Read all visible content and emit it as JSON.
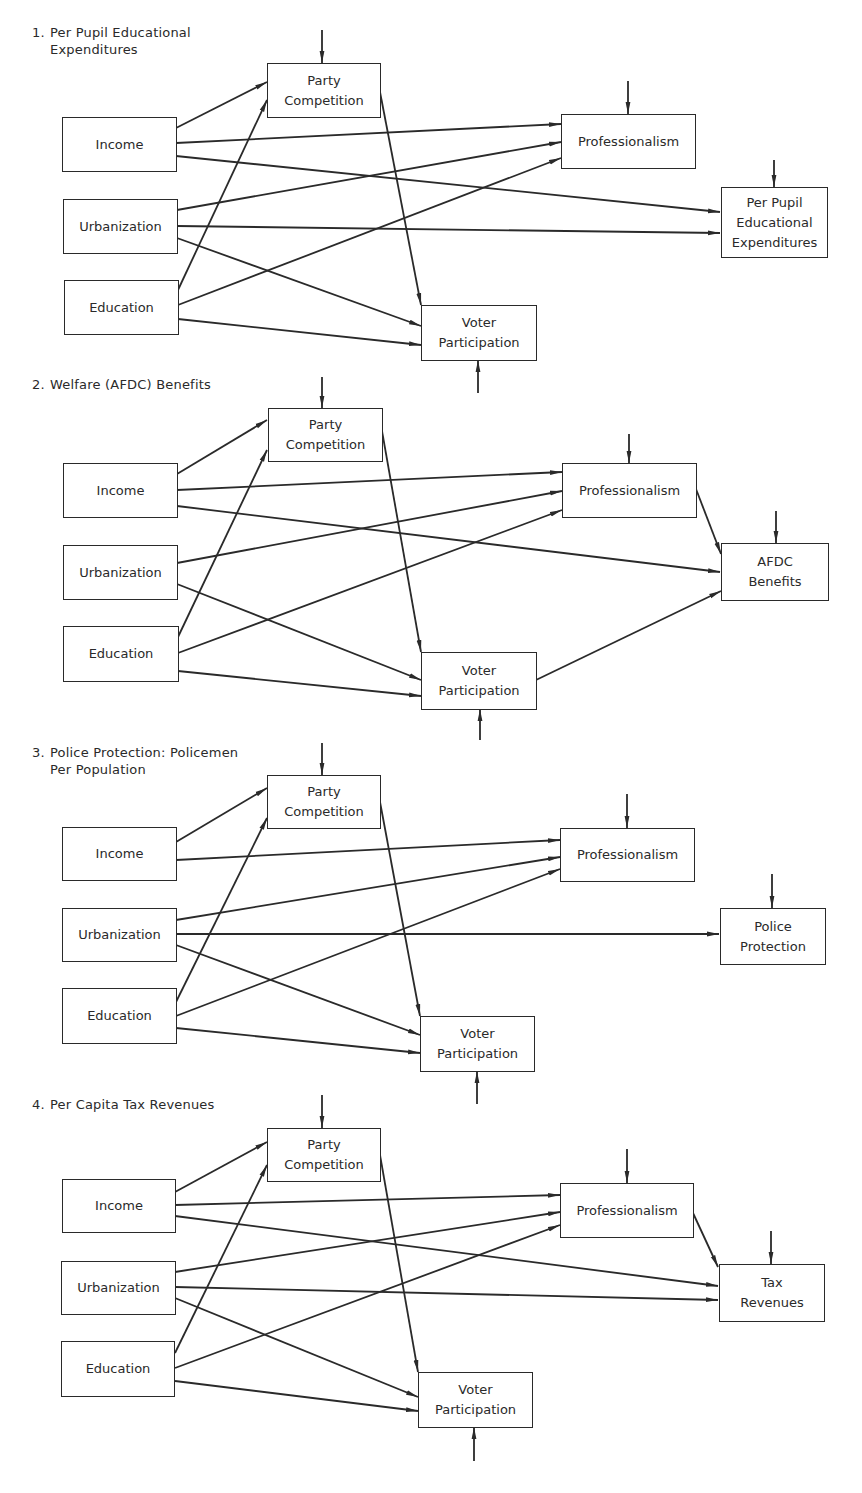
{
  "diagrams": [
    {
      "number": "1.",
      "title_line1": "Per Pupil Educational",
      "title_line2": "Expenditures",
      "nodes": {
        "income": "Income",
        "urbanization": "Urbanization",
        "education": "Education",
        "party": "Party\nCompetition",
        "professionalism": "Professionalism",
        "voter": "Voter\nParticipation",
        "outcome": "Per Pupil\nEducational\nExpenditures"
      }
    },
    {
      "number": "2.",
      "title_line1": "Welfare (AFDC) Benefits",
      "title_line2": "",
      "nodes": {
        "income": "Income",
        "urbanization": "Urbanization",
        "education": "Education",
        "party": "Party\nCompetition",
        "professionalism": "Professionalism",
        "voter": "Voter\nParticipation",
        "outcome": "AFDC\nBenefits"
      }
    },
    {
      "number": "3.",
      "title_line1": "Police Protection: Policemen",
      "title_line2": "Per Population",
      "nodes": {
        "income": "Income",
        "urbanization": "Urbanization",
        "education": "Education",
        "party": "Party\nCompetition",
        "professionalism": "Professionalism",
        "voter": "Voter\nParticipation",
        "outcome": "Police\nProtection"
      }
    },
    {
      "number": "4.",
      "title_line1": "Per Capita Tax Revenues",
      "title_line2": "",
      "nodes": {
        "income": "Income",
        "urbanization": "Urbanization",
        "education": "Education",
        "party": "Party\nCompetition",
        "professionalism": "Professionalism",
        "voter": "Voter\nParticipation",
        "outcome": "Tax\nRevenues"
      }
    }
  ],
  "edges": {
    "diagram1": [
      [
        "Income",
        "Party Competition"
      ],
      [
        "Income",
        "Professionalism"
      ],
      [
        "Income",
        "Per Pupil Educational Expenditures"
      ],
      [
        "Urbanization",
        "Professionalism"
      ],
      [
        "Urbanization",
        "Per Pupil Educational Expenditures"
      ],
      [
        "Urbanization",
        "Voter Participation"
      ],
      [
        "Education",
        "Party Competition"
      ],
      [
        "Education",
        "Professionalism"
      ],
      [
        "Education",
        "Voter Participation"
      ],
      [
        "Party Competition",
        "Voter Participation"
      ]
    ],
    "diagram2": [
      [
        "Income",
        "Party Competition"
      ],
      [
        "Income",
        "Professionalism"
      ],
      [
        "Income",
        "AFDC Benefits"
      ],
      [
        "Urbanization",
        "Professionalism"
      ],
      [
        "Urbanization",
        "Voter Participation"
      ],
      [
        "Education",
        "Party Competition"
      ],
      [
        "Education",
        "Professionalism"
      ],
      [
        "Education",
        "Voter Participation"
      ],
      [
        "Party Competition",
        "Voter Participation"
      ],
      [
        "Professionalism",
        "AFDC Benefits"
      ],
      [
        "Voter Participation",
        "AFDC Benefits"
      ]
    ],
    "diagram3": [
      [
        "Income",
        "Party Competition"
      ],
      [
        "Income",
        "Professionalism"
      ],
      [
        "Urbanization",
        "Professionalism"
      ],
      [
        "Urbanization",
        "Police Protection"
      ],
      [
        "Urbanization",
        "Voter Participation"
      ],
      [
        "Education",
        "Party Competition"
      ],
      [
        "Education",
        "Professionalism"
      ],
      [
        "Education",
        "Voter Participation"
      ],
      [
        "Party Competition",
        "Voter Participation"
      ]
    ],
    "diagram4": [
      [
        "Income",
        "Party Competition"
      ],
      [
        "Income",
        "Professionalism"
      ],
      [
        "Income",
        "Tax Revenues"
      ],
      [
        "Urbanization",
        "Professionalism"
      ],
      [
        "Urbanization",
        "Tax Revenues"
      ],
      [
        "Urbanization",
        "Voter Participation"
      ],
      [
        "Education",
        "Party Competition"
      ],
      [
        "Education",
        "Professionalism"
      ],
      [
        "Education",
        "Voter Participation"
      ],
      [
        "Party Competition",
        "Voter Participation"
      ],
      [
        "Professionalism",
        "Tax Revenues"
      ]
    ]
  },
  "colors": {
    "line": "#2a2a2a",
    "background": "#ffffff"
  }
}
